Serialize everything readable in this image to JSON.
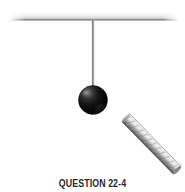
{
  "figure": {
    "title": "QUESTION 22-4",
    "caption": "QUESTION 22-4",
    "background_color": "#ffffff",
    "alt_description": "A dark spherical pendulum bob hangs from a thin vertical string attached to a horizontal ceiling beam; a diagonal metallic bar is positioned to the lower right.",
    "elements": {
      "ceiling_beam": {
        "label": "ceiling-beam",
        "color_top": "#fbfbfb",
        "color_mid": "#e9e9e9",
        "color_bottom": "#8f8f8f",
        "x1": 10,
        "y1": 13,
        "x2": 178,
        "y2": 20
      },
      "string": {
        "label": "pendulum-string",
        "color": "#9a9a9a",
        "x": 93,
        "y_top": 19,
        "y_bottom": 89
      },
      "bob": {
        "label": "pendulum-bob",
        "color_core": "#0d0d0d",
        "color_highlight": "#6e6e6e",
        "cx": 93,
        "cy": 100,
        "r": 14.5
      },
      "diagonal_rod": {
        "label": "magnet-bar",
        "color_light": "#f2f2f2",
        "color_mid": "#b9b9b9",
        "color_dark": "#6d6d6d",
        "x1": 126,
        "y1": 118,
        "x2": 177,
        "y2": 170,
        "thickness": 11
      }
    }
  }
}
